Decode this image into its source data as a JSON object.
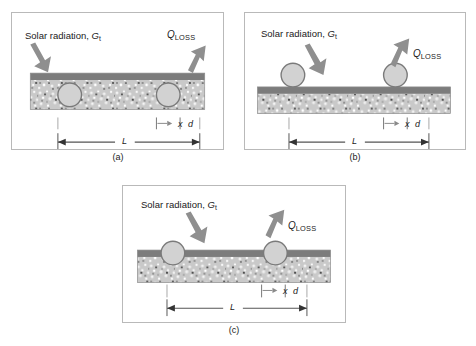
{
  "figure": {
    "background_color": "#ffffff",
    "panel_border_color": "#b9b9b9",
    "arrow_color": "#8f8f8f",
    "slab_top_color": "#7c7c7c",
    "slab_body_color": "#c9c9c9",
    "pipe_fill_color": "#d2d2d2",
    "pipe_stroke_color": "#7a7a7a",
    "dimension_line_color": "#555555",
    "tick_color": "#9a9a9a"
  },
  "labels": {
    "solar_radiation": "Solar radiation, ",
    "solar_symbol": "G",
    "solar_subscript": "t",
    "qloss_symbol": "Q",
    "qloss_subscript": "LOSS",
    "dim_x": "x",
    "dim_d": "d",
    "dim_L": "L"
  },
  "panels": [
    {
      "id": "a",
      "caption": "(a)",
      "pipe_placement": "embedded",
      "description": "Pipes fully embedded inside the concrete slab below the dark absorber surface"
    },
    {
      "id": "b",
      "caption": "(b)",
      "pipe_placement": "on-top",
      "description": "Pipes resting on top of the dark absorber surface of the slab"
    },
    {
      "id": "c",
      "caption": "(c)",
      "pipe_placement": "half-embedded",
      "description": "Pipes half embedded, straddling the dark absorber surface of the slab"
    }
  ]
}
